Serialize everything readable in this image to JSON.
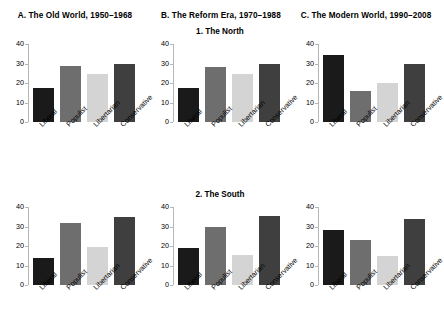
{
  "figure": {
    "background": "#ffffff",
    "column_titles": [
      "A. The Old World, 1950–1968",
      "B. The Reform Era, 1970–1988",
      "C. The Modern World, 1990–2008"
    ],
    "row_titles": [
      "1. The North",
      "2. The South"
    ]
  },
  "axis": {
    "yticks": [
      "0",
      "10",
      "20",
      "30",
      "40"
    ],
    "ytick_values": [
      0,
      10,
      20,
      30,
      40
    ],
    "ymin": 0,
    "ymax": 40,
    "axis_color": "#b6b6b6"
  },
  "categories": [
    "Liberal",
    "Populist",
    "Libertarian",
    "Conservative"
  ],
  "colors": {
    "liberal": "#1a1a1a",
    "populist": "#6e6e6e",
    "libertarian": "#d4d4d4",
    "conservative": "#3f3f3f"
  },
  "chart_data": [
    {
      "type": "bar",
      "title": "A. The Old World, 1950–1968",
      "subtitle": "1. The North",
      "panel": "A1",
      "xlabel": "",
      "ylabel": "",
      "ylim": [
        0,
        40
      ],
      "grid": false,
      "legend": "none",
      "categories": [
        "Liberal",
        "Populist",
        "Libertarian",
        "Conservative"
      ],
      "values": [
        17.5,
        28.5,
        24.5,
        29.5
      ]
    },
    {
      "type": "bar",
      "title": "B. The Reform Era, 1970–1988",
      "subtitle": "1. The North",
      "panel": "B1",
      "xlabel": "",
      "ylabel": "",
      "ylim": [
        0,
        40
      ],
      "grid": false,
      "legend": "none",
      "categories": [
        "Liberal",
        "Populist",
        "Libertarian",
        "Conservative"
      ],
      "values": [
        17.5,
        28.2,
        24.5,
        29.5
      ]
    },
    {
      "type": "bar",
      "title": "C. The Modern World, 1990–2008",
      "subtitle": "1. The North",
      "panel": "C1",
      "xlabel": "",
      "ylabel": "",
      "ylim": [
        0,
        40
      ],
      "grid": false,
      "legend": "none",
      "categories": [
        "Liberal",
        "Populist",
        "Libertarian",
        "Conservative"
      ],
      "values": [
        34.5,
        16.0,
        20.0,
        30.0
      ]
    },
    {
      "type": "bar",
      "title": "A. The Old World, 1950–1968",
      "subtitle": "2. The South",
      "panel": "A2",
      "xlabel": "",
      "ylabel": "",
      "ylim": [
        0,
        40
      ],
      "grid": false,
      "legend": "none",
      "categories": [
        "Liberal",
        "Populist",
        "Libertarian",
        "Conservative"
      ],
      "values": [
        13.8,
        31.7,
        19.5,
        35.0
      ]
    },
    {
      "type": "bar",
      "title": "B. The Reform Era, 1970–1988",
      "subtitle": "2. The South",
      "panel": "B2",
      "xlabel": "",
      "ylabel": "",
      "ylim": [
        0,
        40
      ],
      "grid": false,
      "legend": "none",
      "categories": [
        "Liberal",
        "Populist",
        "Libertarian",
        "Conservative"
      ],
      "values": [
        19.2,
        30.0,
        15.3,
        35.4
      ]
    },
    {
      "type": "bar",
      "title": "C. The Modern World, 1990–2008",
      "subtitle": "2. The South",
      "panel": "C2",
      "xlabel": "",
      "ylabel": "",
      "ylim": [
        0,
        40
      ],
      "grid": false,
      "legend": "none",
      "categories": [
        "Liberal",
        "Populist",
        "Libertarian",
        "Conservative"
      ],
      "values": [
        28.0,
        23.0,
        14.7,
        34.0
      ]
    }
  ]
}
